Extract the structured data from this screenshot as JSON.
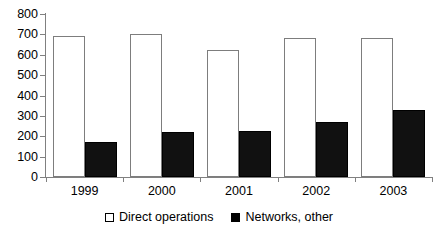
{
  "chart_data": {
    "type": "bar",
    "title": "",
    "subtitle": "",
    "xlabel": "",
    "ylabel": "",
    "categories": [
      "1999",
      "2000",
      "2001",
      "2002",
      "2003"
    ],
    "series": [
      {
        "name": "Direct operations",
        "color": "#ffffff",
        "border_color": "#7d7d7d",
        "values": [
          690,
          700,
          625,
          680,
          680
        ]
      },
      {
        "name": "Networks, other",
        "color": "#111111",
        "border_color": "#000000",
        "values": [
          170,
          220,
          225,
          270,
          330
        ]
      }
    ],
    "ylim": [
      0,
      800
    ],
    "ytick_step": 100,
    "yticks": [
      0,
      100,
      200,
      300,
      400,
      500,
      600,
      700,
      800
    ],
    "ytick_labels": [
      "0",
      "100",
      "200",
      "300",
      "400",
      "500",
      "600",
      "700",
      "800"
    ],
    "grid": false,
    "legend_position": "bottom-center",
    "legend_entries": [
      "Direct operations",
      "Networks, other"
    ],
    "annotations": []
  },
  "colors": {
    "background": "#ffffff",
    "axis": "#808080",
    "text": "#000000",
    "series_direct": "#ffffff",
    "series_networks": "#111111"
  }
}
